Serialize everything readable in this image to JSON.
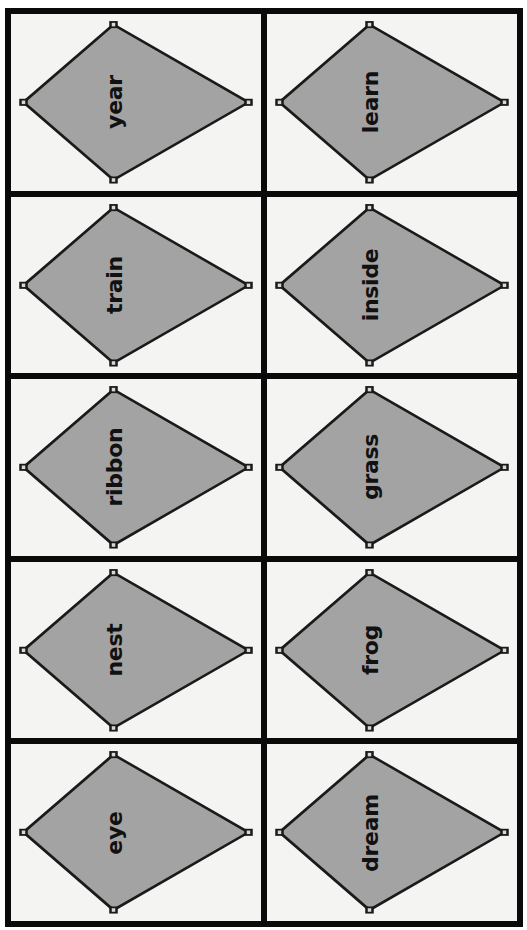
{
  "sheet": {
    "layout": {
      "columns": 2,
      "rows": 5
    },
    "colors": {
      "border": "#0a0a0a",
      "card_background": "#f4f4f2",
      "kite_fill": "#a3a3a3",
      "kite_stroke": "#1a1a1a",
      "text": "#111111"
    },
    "cards": [
      {
        "word": "year",
        "row": 1,
        "col": 1
      },
      {
        "word": "learn",
        "row": 1,
        "col": 2
      },
      {
        "word": "train",
        "row": 2,
        "col": 1
      },
      {
        "word": "inside",
        "row": 2,
        "col": 2
      },
      {
        "word": "ribbon",
        "row": 3,
        "col": 1
      },
      {
        "word": "grass",
        "row": 3,
        "col": 2
      },
      {
        "word": "nest",
        "row": 4,
        "col": 1
      },
      {
        "word": "frog",
        "row": 4,
        "col": 2
      },
      {
        "word": "eye",
        "row": 5,
        "col": 1
      },
      {
        "word": "dream",
        "row": 5,
        "col": 2
      }
    ]
  }
}
